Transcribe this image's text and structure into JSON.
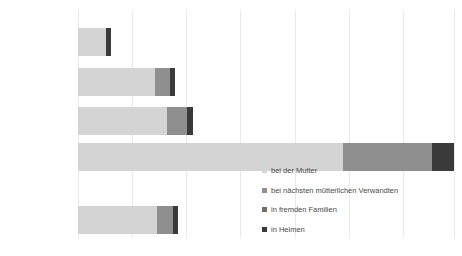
{
  "chart_data": {
    "type": "bar",
    "orientation": "horizontal",
    "stacked": true,
    "title": "",
    "xlabel": "",
    "ylabel": "",
    "grid": true,
    "legend_position": "inside-right",
    "xlim": [
      0,
      100
    ],
    "gridline_interval": 14.4,
    "categories": [
      "Sowjetunion",
      "Großbritannien",
      "Frankreich",
      "USA",
      "Sonstige Nationen"
    ],
    "series": [
      {
        "name": "bei der Mutter",
        "color": "#d4d4d4",
        "values": [
          7.4,
          20.6,
          23.6,
          70.5,
          20.9
        ]
      },
      {
        "name": "bei nächsten mütterlichen Verwandten",
        "color": "#8f8f8f",
        "values": [
          0.0,
          4.0,
          5.5,
          23.6,
          4.3
        ]
      },
      {
        "name": "in fremden Familien",
        "color": "#6e6e6e",
        "values": [
          0.0,
          0.0,
          0.0,
          0.0,
          0.0
        ]
      },
      {
        "name": "in Heimen",
        "color": "#3a3a3a",
        "values": [
          1.5,
          1.2,
          1.5,
          5.8,
          1.5
        ]
      }
    ],
    "totals": [
      8.9,
      25.8,
      30.7,
      99.9,
      26.7
    ]
  },
  "legend": {
    "items": [
      {
        "label": "bei der Mutter",
        "swatch_class": "sw-0"
      },
      {
        "label": "bei nächsten mütterlichen Verwandten",
        "swatch_class": "sw-1"
      },
      {
        "label": "in fremden Familien",
        "swatch_class": "sw-2"
      },
      {
        "label": "in Heimen",
        "swatch_class": "sw-3"
      }
    ]
  },
  "axis": {
    "gridline_positions": [
      0,
      14.4,
      28.8,
      43.2,
      57.6,
      72.0,
      86.4,
      100.0
    ]
  },
  "colors": {
    "series_1": "#d4d4d4",
    "series_2": "#8f8f8f",
    "series_3": "#6e6e6e",
    "series_4": "#3a3a3a",
    "gridline": "#e9e9e9",
    "text": "#595959",
    "background": "#ffffff"
  }
}
